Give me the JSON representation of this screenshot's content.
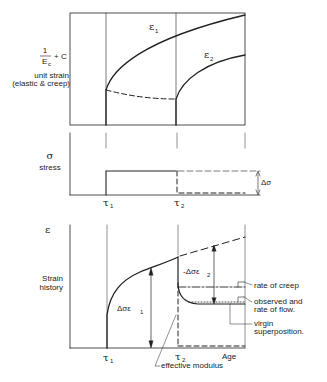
{
  "top_panel": {
    "y_label_formula": "1/Ec + C",
    "y_label_fraction_num": "1",
    "y_label_fraction_den": "E",
    "y_label_fraction_den_sub": "c",
    "y_label_plus": "+ C",
    "y_label_line1": "unit strain",
    "y_label_line2": "(elastic & creep)",
    "curve1_label": "ε",
    "curve1_sub": "1",
    "curve2_label": "ε",
    "curve2_sub": "2"
  },
  "middle_panel": {
    "y_symbol": "σ",
    "y_label": "stress",
    "delta_label": "Δσ",
    "tick1": "τ",
    "tick1_sub": "1",
    "tick2": "τ",
    "tick2_sub": "2"
  },
  "bottom_panel": {
    "y_symbol": "ε",
    "y_label_line1": "Strain",
    "y_label_line2": "history",
    "arrow1_label": "Δσε",
    "arrow1_sub": "1",
    "arrow2_label": "-Δσε",
    "arrow2_sub": "2",
    "tick1": "τ",
    "tick1_sub": "1",
    "tick2": "τ",
    "tick2_sub": "2",
    "x_label": "Age",
    "annotations": {
      "rate_of_creep": "rate of creep",
      "observed_line1": "observed and",
      "observed_line2": "rate of flow.",
      "virgin_line1": "virgin",
      "virgin_line2": "superposition.",
      "effective_modulus": "effective modulus"
    }
  }
}
